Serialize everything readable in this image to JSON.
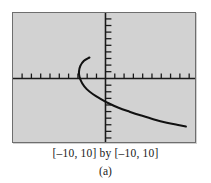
{
  "figure": {
    "range_caption": "[–10, 10] by [–10, 10]",
    "part_label": "(a)",
    "frame_color": "#6e6e6e",
    "plot_background": "#d2d2d2",
    "curve_color": "#111111",
    "axis_color": "#1a1a1a"
  },
  "chart_data": {
    "type": "line",
    "title": "",
    "subtitle": "",
    "xlabel": "",
    "ylabel": "",
    "xlim": [
      -10,
      10
    ],
    "ylim": [
      -10,
      10
    ],
    "grid": false,
    "legend": null,
    "axis_tick_interval": 1,
    "x_tick_values": [
      -9,
      -8,
      -7,
      -6,
      -5,
      -4,
      -3,
      -2,
      -1,
      1,
      2,
      3,
      4,
      5,
      6,
      7,
      8,
      9
    ],
    "y_tick_values": [
      -9,
      -8,
      -7,
      -6,
      -5,
      -4,
      -3,
      -2,
      -1,
      1,
      2,
      3,
      4,
      5,
      6,
      7,
      8,
      9
    ],
    "tick_labels_shown": false,
    "annotations": [],
    "series": [
      {
        "name": "sideways parabola (upper and lower branch)",
        "x": [
          -1.6,
          -2.2,
          -2.6,
          -2.75,
          -2.7,
          -2.4,
          -1.9,
          -1.2,
          -0.4,
          0.5,
          1.6,
          2.8,
          4.1,
          5.5,
          6.9,
          8.3,
          9.0
        ],
        "y": [
          3.1,
          2.6,
          1.8,
          0.9,
          0.1,
          -0.9,
          -1.8,
          -2.6,
          -3.3,
          -4.0,
          -4.7,
          -5.3,
          -5.9,
          -6.5,
          -7.0,
          -7.4,
          -7.6
        ]
      }
    ]
  }
}
